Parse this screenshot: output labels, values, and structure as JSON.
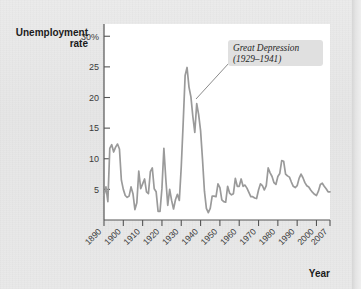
{
  "figure": {
    "plot_background": "#ffffff",
    "page_background": "#e9e9e9",
    "line_color": "#9a9a9a",
    "axis_color": "#555555",
    "text_color": "#1b1b1b"
  },
  "labels": {
    "y_axis_line1": "Unemployment",
    "y_axis_line2": "rate",
    "x_axis": "Year"
  },
  "annotation": {
    "line1": "Great Depression",
    "line2": "(1929–1941)",
    "box_fill": "#e0e0e0"
  },
  "chart_data": {
    "type": "line",
    "title": "",
    "xlabel": "Year",
    "ylabel": "Unemployment rate",
    "xlim": [
      1890,
      2007
    ],
    "ylim": [
      0,
      32
    ],
    "grid": false,
    "legend": null,
    "ytick_labels": [
      "30%",
      "25",
      "20",
      "15",
      "10",
      "5"
    ],
    "ytick_values": [
      30,
      25,
      20,
      15,
      10,
      5
    ],
    "xtick_labels": [
      "1890",
      "1900",
      "1910",
      "1920",
      "1930",
      "1940",
      "1950",
      "1960",
      "1970",
      "1980",
      "1990",
      "2000",
      "2007"
    ],
    "xtick_values": [
      1890,
      1900,
      1910,
      1920,
      1930,
      1940,
      1950,
      1960,
      1970,
      1980,
      1990,
      2000,
      2007
    ],
    "annotations": [
      {
        "text": "Great Depression (1929–1941)",
        "points_to_x": 1933,
        "points_to_y": 25
      }
    ],
    "series": [
      {
        "name": "Unemployment rate",
        "x": [
          1890,
          1891,
          1892,
          1893,
          1894,
          1895,
          1896,
          1897,
          1898,
          1899,
          1900,
          1901,
          1902,
          1903,
          1904,
          1905,
          1906,
          1907,
          1908,
          1909,
          1910,
          1911,
          1912,
          1913,
          1914,
          1915,
          1916,
          1917,
          1918,
          1919,
          1920,
          1921,
          1922,
          1923,
          1924,
          1925,
          1926,
          1927,
          1928,
          1929,
          1930,
          1931,
          1932,
          1933,
          1934,
          1935,
          1936,
          1937,
          1938,
          1939,
          1940,
          1941,
          1942,
          1943,
          1944,
          1945,
          1946,
          1947,
          1948,
          1949,
          1950,
          1951,
          1952,
          1953,
          1954,
          1955,
          1956,
          1957,
          1958,
          1959,
          1960,
          1961,
          1962,
          1963,
          1964,
          1965,
          1966,
          1967,
          1968,
          1969,
          1970,
          1971,
          1972,
          1973,
          1974,
          1975,
          1976,
          1977,
          1978,
          1979,
          1980,
          1981,
          1982,
          1983,
          1984,
          1985,
          1986,
          1987,
          1988,
          1989,
          1990,
          1991,
          1992,
          1993,
          1994,
          1995,
          1996,
          1997,
          1998,
          1999,
          2000,
          2001,
          2002,
          2003,
          2004,
          2005,
          2006,
          2007
        ],
        "values": [
          4.0,
          5.4,
          3.0,
          11.7,
          12.3,
          11.1,
          11.9,
          12.4,
          11.6,
          6.5,
          5.0,
          4.0,
          3.7,
          3.9,
          5.4,
          4.3,
          1.7,
          2.8,
          8.0,
          5.1,
          5.9,
          6.7,
          4.6,
          4.3,
          7.9,
          8.5,
          5.1,
          4.6,
          1.4,
          1.4,
          5.2,
          11.7,
          6.7,
          2.4,
          5.0,
          3.2,
          1.8,
          3.3,
          4.2,
          3.2,
          8.7,
          15.9,
          23.6,
          24.9,
          21.7,
          20.1,
          16.9,
          14.3,
          19.0,
          17.2,
          14.6,
          9.9,
          4.7,
          1.9,
          1.2,
          1.9,
          3.9,
          3.9,
          3.8,
          5.9,
          5.3,
          3.3,
          3.0,
          2.9,
          5.5,
          4.4,
          4.1,
          4.3,
          6.8,
          5.5,
          5.5,
          6.7,
          5.5,
          5.7,
          5.2,
          4.5,
          3.8,
          3.8,
          3.6,
          3.5,
          4.9,
          5.9,
          5.6,
          4.9,
          5.6,
          8.5,
          7.7,
          7.1,
          6.1,
          5.8,
          7.1,
          7.6,
          9.7,
          9.6,
          7.5,
          7.2,
          7.0,
          6.2,
          5.5,
          5.3,
          5.6,
          6.8,
          7.5,
          6.9,
          6.1,
          5.6,
          5.4,
          4.9,
          4.5,
          4.2,
          4.0,
          4.7,
          5.8,
          6.0,
          5.5,
          5.1,
          4.6,
          4.6
        ]
      }
    ]
  }
}
